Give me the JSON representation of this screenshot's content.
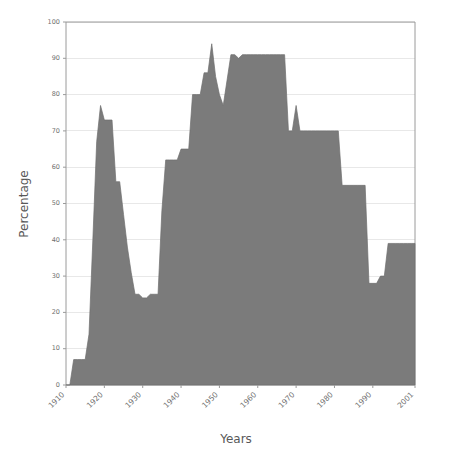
{
  "chart_data": {
    "type": "area",
    "title": "",
    "xlabel": "Years",
    "ylabel": "Percentage",
    "xlim": [
      1910,
      2001
    ],
    "ylim": [
      0,
      100
    ],
    "grid": true,
    "legend": false,
    "series_color": "#7b7b7b",
    "x_tick_labels": [
      "1910",
      "1920",
      "1930",
      "1940",
      "1950",
      "1960",
      "1970",
      "1980",
      "1990",
      "2001"
    ],
    "x_tick_values": [
      1910,
      1920,
      1930,
      1940,
      1950,
      1960,
      1970,
      1980,
      1990,
      2001
    ],
    "y_tick_labels": [
      "0",
      "10",
      "20",
      "30",
      "40",
      "50",
      "60",
      "70",
      "80",
      "90",
      "100"
    ],
    "y_tick_values": [
      0,
      10,
      20,
      30,
      40,
      50,
      60,
      70,
      80,
      90,
      100
    ],
    "x": [
      1910,
      1911,
      1912,
      1913,
      1914,
      1915,
      1916,
      1917,
      1918,
      1919,
      1920,
      1921,
      1922,
      1923,
      1924,
      1925,
      1926,
      1927,
      1928,
      1929,
      1930,
      1931,
      1932,
      1933,
      1934,
      1935,
      1936,
      1937,
      1938,
      1939,
      1940,
      1941,
      1942,
      1943,
      1944,
      1945,
      1946,
      1947,
      1948,
      1949,
      1950,
      1951,
      1952,
      1953,
      1954,
      1955,
      1956,
      1957,
      1958,
      1959,
      1960,
      1961,
      1962,
      1963,
      1964,
      1965,
      1966,
      1967,
      1968,
      1969,
      1970,
      1971,
      1972,
      1973,
      1974,
      1975,
      1976,
      1977,
      1978,
      1979,
      1980,
      1981,
      1982,
      1983,
      1984,
      1985,
      1986,
      1987,
      1988,
      1989,
      1990,
      1991,
      1992,
      1993,
      1994,
      1995,
      1996,
      1997,
      1998,
      1999,
      2000,
      2001
    ],
    "values": [
      0,
      0,
      7,
      7,
      7,
      7,
      14,
      40,
      67,
      77,
      73,
      73,
      73,
      56,
      56,
      47,
      38,
      31,
      25,
      25,
      24,
      24,
      25,
      25,
      25,
      48,
      62,
      62,
      62,
      62,
      65,
      65,
      65,
      80,
      80,
      80,
      86,
      86,
      94,
      85,
      80,
      77,
      84,
      91,
      91,
      90,
      91,
      91,
      91,
      91,
      91,
      91,
      91,
      91,
      91,
      91,
      91,
      91,
      70,
      70,
      77,
      70,
      70,
      70,
      70,
      70,
      70,
      70,
      70,
      70,
      70,
      70,
      55,
      55,
      55,
      55,
      55,
      55,
      55,
      28,
      28,
      28,
      30,
      30,
      39,
      39,
      39,
      39,
      39,
      39,
      39,
      39
    ]
  },
  "axis_titles": {
    "x": "Years",
    "y": "Percentage"
  }
}
